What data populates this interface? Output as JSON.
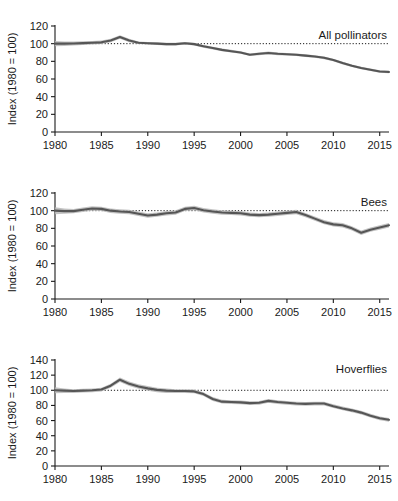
{
  "figure": {
    "background": "#ffffff",
    "line_color": "#565656",
    "band_color": "#b9b9b9",
    "axis_color": "#1a1a1a",
    "reference_line_value": 100,
    "shared_xlabel": "",
    "shared_ylabel": "Index (1980 = 100)",
    "x_tick_labels": [
      "1980",
      "1985",
      "1990",
      "1995",
      "2000",
      "2005",
      "2010",
      "2015"
    ],
    "x_tick_values": [
      1980,
      1985,
      1990,
      1995,
      2000,
      2005,
      2010,
      2015
    ]
  },
  "chart_data": [
    {
      "type": "line",
      "title": "All pollinators",
      "xlabel": "",
      "ylabel": "Index (1980 = 100)",
      "xlim": [
        1980,
        2016
      ],
      "ylim": [
        0,
        120
      ],
      "ytick_labels": [
        "0",
        "20",
        "40",
        "60",
        "80",
        "100",
        "120"
      ],
      "yticks": [
        0,
        20,
        40,
        60,
        80,
        100,
        120
      ],
      "xticks": [
        1980,
        1985,
        1990,
        1995,
        2000,
        2005,
        2010,
        2015
      ],
      "grid": false,
      "legend": "none",
      "reference_line": 100,
      "annotations": [
        "All pollinators"
      ],
      "x": [
        1980,
        1981,
        1982,
        1983,
        1984,
        1985,
        1986,
        1987,
        1988,
        1989,
        1990,
        1991,
        1992,
        1993,
        1994,
        1995,
        1996,
        1997,
        1998,
        1999,
        2000,
        2001,
        2002,
        2003,
        2004,
        2005,
        2006,
        2007,
        2008,
        2009,
        2010,
        2011,
        2012,
        2013,
        2014,
        2015,
        2016
      ],
      "series": [
        {
          "name": "All pollinators index",
          "values": [
            100,
            100,
            100.2,
            100.6,
            101,
            101.5,
            103.5,
            107.5,
            103.5,
            101,
            100.5,
            100,
            99.5,
            99.5,
            100.5,
            99.5,
            97,
            95,
            93,
            91.5,
            90,
            87.5,
            88.5,
            89.5,
            88.5,
            88,
            87.5,
            86.5,
            85.5,
            84,
            81.5,
            78,
            75,
            72.5,
            70.5,
            68.5,
            68
          ],
          "ci_lower": [
            97,
            97.5,
            98,
            98.5,
            99,
            99.5,
            101.5,
            105.5,
            101.5,
            99.5,
            99,
            98.5,
            98,
            98,
            99,
            98,
            95.5,
            93.5,
            91.5,
            90,
            88.5,
            86,
            87,
            88,
            87,
            86.5,
            86,
            85,
            84,
            82.5,
            80,
            76.5,
            73.5,
            71,
            69,
            67,
            66.5
          ],
          "ci_upper": [
            103,
            102.5,
            102.4,
            102.7,
            103,
            103.5,
            105.5,
            109.5,
            105.5,
            102.5,
            102,
            101.5,
            101,
            101,
            102,
            101,
            98.5,
            96.5,
            94.5,
            93,
            91.5,
            89,
            90,
            91,
            90,
            89.5,
            89,
            88,
            87,
            85.5,
            83,
            79.5,
            76.5,
            74,
            72,
            70,
            69.5
          ]
        }
      ]
    },
    {
      "type": "line",
      "title": "Bees",
      "xlabel": "",
      "ylabel": "Index (1980 = 100)",
      "xlim": [
        1980,
        2016
      ],
      "ylim": [
        0,
        120
      ],
      "ytick_labels": [
        "0",
        "20",
        "40",
        "60",
        "80",
        "100",
        "120"
      ],
      "yticks": [
        0,
        20,
        40,
        60,
        80,
        100,
        120
      ],
      "xticks": [
        1980,
        1985,
        1990,
        1995,
        2000,
        2005,
        2010,
        2015
      ],
      "grid": false,
      "legend": "none",
      "reference_line": 100,
      "annotations": [
        "Bees"
      ],
      "x": [
        1980,
        1981,
        1982,
        1983,
        1984,
        1985,
        1986,
        1987,
        1988,
        1989,
        1990,
        1991,
        1992,
        1993,
        1994,
        1995,
        1996,
        1997,
        1998,
        1999,
        2000,
        2001,
        2002,
        2003,
        2004,
        2005,
        2006,
        2007,
        2008,
        2009,
        2010,
        2011,
        2012,
        2013,
        2014,
        2015,
        2016
      ],
      "series": [
        {
          "name": "Bees index",
          "values": [
            100,
            99.5,
            99.5,
            101,
            102.5,
            102,
            100,
            99,
            98.5,
            96.5,
            94.5,
            95.5,
            97,
            98,
            102,
            103,
            100.5,
            99,
            98,
            97.5,
            97,
            95.5,
            95,
            95.5,
            96.5,
            97.5,
            98.5,
            95,
            91,
            87,
            84.5,
            83.5,
            80,
            75,
            78.5,
            81,
            83.5
          ],
          "ci_lower": [
            96,
            96.5,
            97,
            98.5,
            100,
            99.5,
            97.5,
            96.5,
            96,
            94,
            92,
            93,
            94.5,
            95.5,
            99.5,
            100.5,
            98,
            96.5,
            95.5,
            95,
            94.5,
            93,
            92.5,
            93,
            94,
            95,
            96,
            92.5,
            88.5,
            84.5,
            82,
            81,
            77.5,
            72.5,
            76,
            78.5,
            81
          ],
          "ci_upper": [
            104,
            102.5,
            102,
            103.5,
            105,
            104.5,
            102.5,
            101.5,
            101,
            99,
            97,
            98,
            99.5,
            100.5,
            104.5,
            105.5,
            103,
            101.5,
            100.5,
            100,
            99.5,
            98,
            97.5,
            98,
            99,
            100,
            101,
            97.5,
            93.5,
            89.5,
            87,
            86,
            82.5,
            77.5,
            81,
            83.5,
            86
          ]
        }
      ]
    },
    {
      "type": "line",
      "title": "Hoverflies",
      "xlabel": "",
      "ylabel": "Index (1980 = 100)",
      "xlim": [
        1980,
        2016
      ],
      "ylim": [
        0,
        140
      ],
      "ytick_labels": [
        "0",
        "20",
        "40",
        "60",
        "80",
        "100",
        "120",
        "140"
      ],
      "yticks": [
        0,
        20,
        40,
        60,
        80,
        100,
        120,
        140
      ],
      "xticks": [
        1980,
        1985,
        1990,
        1995,
        2000,
        2005,
        2010,
        2015
      ],
      "grid": false,
      "legend": "none",
      "reference_line": 100,
      "annotations": [
        "Hoverflies"
      ],
      "x": [
        1980,
        1981,
        1982,
        1983,
        1984,
        1985,
        1986,
        1987,
        1988,
        1989,
        1990,
        1991,
        1992,
        1993,
        1994,
        1995,
        1996,
        1997,
        1998,
        1999,
        2000,
        2001,
        2002,
        2003,
        2004,
        2005,
        2006,
        2007,
        2008,
        2009,
        2010,
        2011,
        2012,
        2013,
        2014,
        2015,
        2016
      ],
      "series": [
        {
          "name": "Hoverflies index",
          "values": [
            100,
            99.5,
            99,
            99.5,
            100,
            101,
            106,
            114,
            108.5,
            105,
            102.5,
            100.5,
            99.5,
            99,
            99,
            98.5,
            95,
            88.5,
            85,
            84.5,
            84,
            83,
            83.5,
            86,
            84.5,
            83.5,
            82.5,
            82,
            82.5,
            82.5,
            79,
            76,
            73.5,
            70.5,
            66.5,
            63,
            61
          ],
          "ci_lower": [
            96,
            96.5,
            96.5,
            97,
            97.5,
            98.5,
            103.5,
            111,
            105.5,
            102,
            99.5,
            97.5,
            96.5,
            96.5,
            96.5,
            96,
            92.5,
            86,
            82.5,
            82,
            81.5,
            80.5,
            81,
            83.5,
            82,
            81,
            80,
            79.5,
            80,
            80,
            76.5,
            73.5,
            71,
            68,
            64,
            60.5,
            58.5
          ],
          "ci_upper": [
            104,
            102.5,
            101.5,
            102,
            102.5,
            103.5,
            108.5,
            117,
            111.5,
            108,
            105.5,
            103.5,
            102.5,
            101.5,
            101.5,
            101,
            97.5,
            91,
            87.5,
            87,
            86.5,
            85.5,
            86,
            88.5,
            87,
            86,
            85,
            84.5,
            85,
            85,
            81.5,
            78.5,
            76,
            73,
            69,
            65.5,
            63.5
          ]
        }
      ]
    }
  ]
}
